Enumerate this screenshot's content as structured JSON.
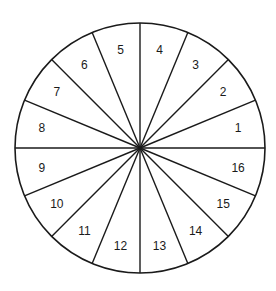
{
  "diagram": {
    "type": "segmented-wheel",
    "sector_count": 16,
    "center": [
      140,
      148
    ],
    "radius": 125,
    "label_radius": 100,
    "stroke_color": "#1a1a1a",
    "fill_color": "#ffffff",
    "sectors": [
      {
        "label": "1"
      },
      {
        "label": "2"
      },
      {
        "label": "3"
      },
      {
        "label": "4"
      },
      {
        "label": "5"
      },
      {
        "label": "6"
      },
      {
        "label": "7"
      },
      {
        "label": "8"
      },
      {
        "label": "9"
      },
      {
        "label": "10"
      },
      {
        "label": "11"
      },
      {
        "label": "12"
      },
      {
        "label": "13"
      },
      {
        "label": "14"
      },
      {
        "label": "15"
      },
      {
        "label": "16"
      }
    ]
  }
}
